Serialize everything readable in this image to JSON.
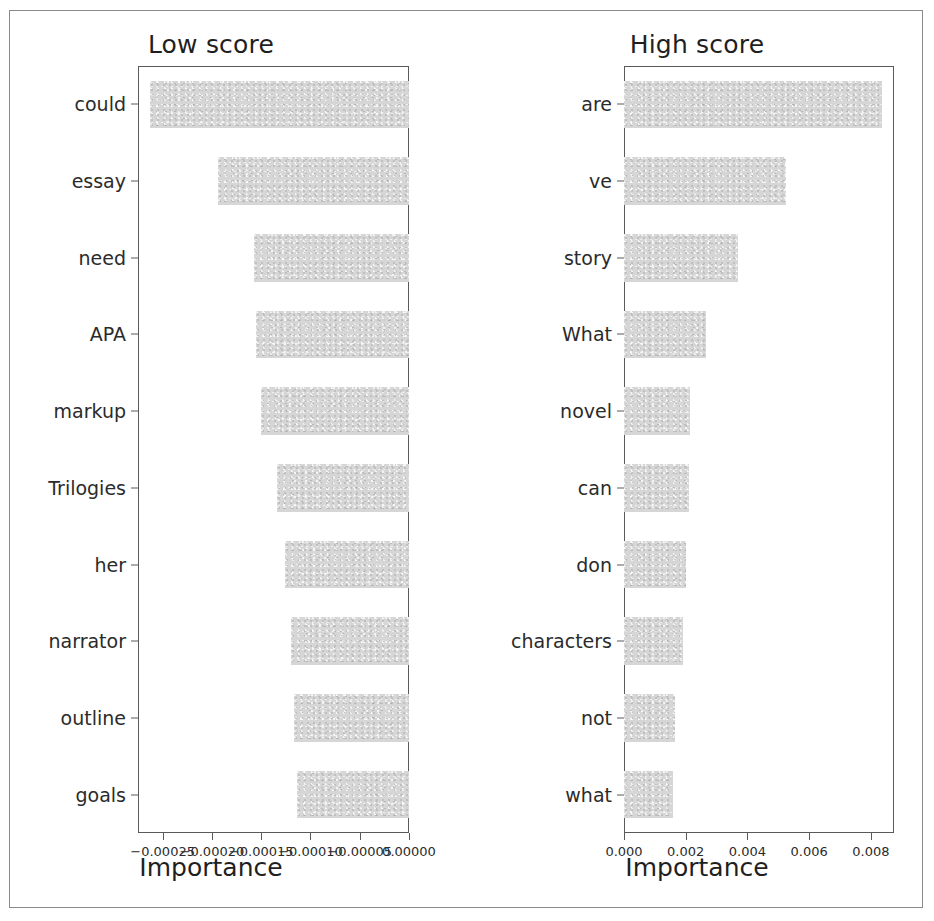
{
  "figure": {
    "background": "#ffffff",
    "bar_color": "#d6d6d6",
    "axis_color": "#5a5a5a",
    "frame_color": "#8a8a8a"
  },
  "chart_data": [
    {
      "type": "bar",
      "orientation": "horizontal",
      "title": "Low score",
      "xlabel": "Importance",
      "ylabel": "",
      "categories": [
        "could",
        "essay",
        "need",
        "APA",
        "markup",
        "Trilogies",
        "her",
        "narrator",
        "outline",
        "goals"
      ],
      "values": [
        -0.000263,
        -0.000194,
        -0.000157,
        -0.000155,
        -0.00015,
        -0.000134,
        -0.000126,
        -0.00012,
        -0.000117,
        -0.000114
      ],
      "xlim": [
        -0.000275,
        0.0
      ],
      "xticks": [
        -0.00025,
        -0.0002,
        -0.00015,
        -0.0001,
        -5e-05,
        0.0
      ],
      "xticklabels": [
        "−0.00025",
        "−0.00020",
        "−0.00015",
        "−0.00010",
        "−0.00005",
        "0.00000"
      ],
      "grid": false,
      "legend": "none"
    },
    {
      "type": "bar",
      "orientation": "horizontal",
      "title": "High score",
      "xlabel": "Importance",
      "ylabel": "",
      "categories": [
        "are",
        "ve",
        "story",
        "What",
        "novel",
        "can",
        "don",
        "characters",
        "not",
        "what"
      ],
      "values": [
        0.00835,
        0.00525,
        0.0037,
        0.00265,
        0.00215,
        0.0021,
        0.002,
        0.0019,
        0.00165,
        0.00158
      ],
      "xlim": [
        0.0,
        0.00875
      ],
      "xticks": [
        0.0,
        0.002,
        0.004,
        0.006,
        0.008
      ],
      "xticklabels": [
        "0.000",
        "0.002",
        "0.004",
        "0.006",
        "0.008"
      ],
      "grid": false,
      "legend": "none"
    }
  ]
}
